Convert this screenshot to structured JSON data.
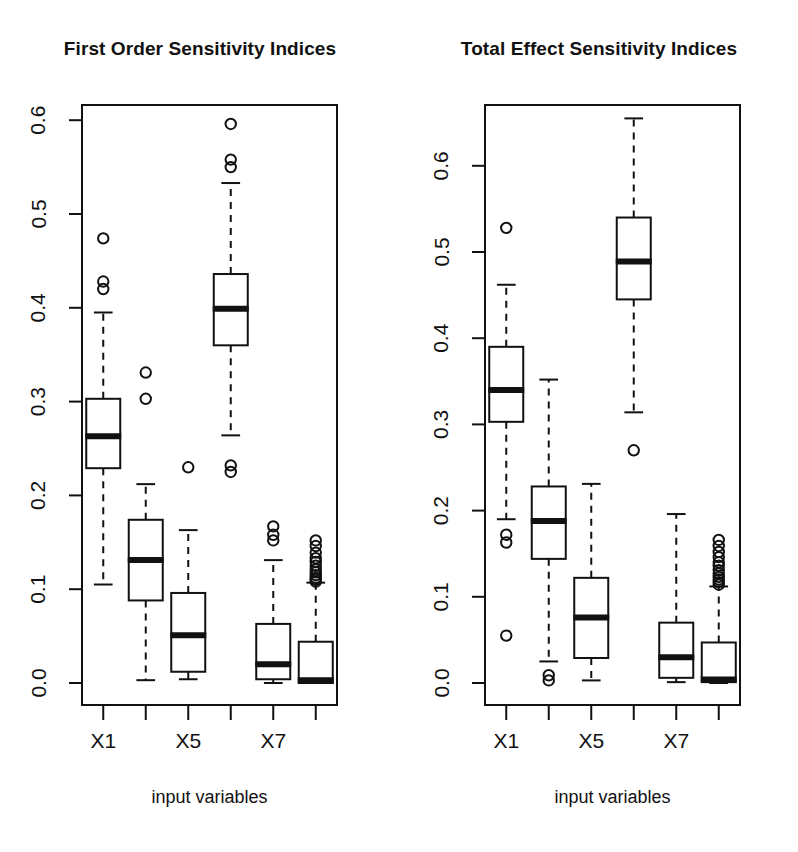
{
  "figure": {
    "background": "#ffffff",
    "ink": "#111111",
    "panels": [
      {
        "id": "first-order",
        "title": "First Order Sensitivity Indices",
        "xlabel": "input variables",
        "ylabel": "",
        "x_tick_labels": [
          "X1",
          "",
          "X5",
          "",
          "X7",
          ""
        ],
        "x_categories": [
          "X1",
          "X2",
          "X3",
          "X4",
          "X5",
          "X6"
        ],
        "y_tick_labels": [
          "0.0",
          "0.1",
          "0.2",
          "0.3",
          "0.4",
          "0.5",
          "0.6"
        ],
        "y_tick_values": [
          0.0,
          0.1,
          0.2,
          0.3,
          0.4,
          0.5,
          0.6
        ],
        "ylim": [
          -0.035,
          0.635
        ],
        "boxes": [
          {
            "category": "X1",
            "q1": 0.229,
            "median": 0.263,
            "q3": 0.303,
            "whisker_low": 0.105,
            "whisker_high": 0.395,
            "outliers": [
              0.474,
              0.428,
              0.42
            ]
          },
          {
            "category": "X2",
            "q1": 0.088,
            "median": 0.131,
            "q3": 0.174,
            "whisker_low": 0.003,
            "whisker_high": 0.212,
            "outliers": [
              0.331,
              0.303
            ]
          },
          {
            "category": "X3",
            "q1": 0.012,
            "median": 0.051,
            "q3": 0.096,
            "whisker_low": 0.004,
            "whisker_high": 0.163,
            "outliers": [
              0.23
            ]
          },
          {
            "category": "X4",
            "q1": 0.36,
            "median": 0.399,
            "q3": 0.436,
            "whisker_low": 0.264,
            "whisker_high": 0.533,
            "outliers": [
              0.596,
              0.558,
              0.55,
              0.232,
              0.225
            ]
          },
          {
            "category": "X5",
            "q1": 0.004,
            "median": 0.02,
            "q3": 0.063,
            "whisker_low": 0.0,
            "whisker_high": 0.131,
            "outliers": [
              0.167,
              0.158,
              0.152
            ]
          },
          {
            "category": "X6",
            "q1": 0.0,
            "median": 0.003,
            "q3": 0.044,
            "whisker_low": 0.0,
            "whisker_high": 0.107,
            "outliers": [
              0.152,
              0.146,
              0.139,
              0.133,
              0.129,
              0.125,
              0.121,
              0.118,
              0.115,
              0.112,
              0.11,
              0.108
            ]
          }
        ]
      },
      {
        "id": "total-effect",
        "title": "Total Effect Sensitivity Indices",
        "xlabel": "input variables",
        "ylabel": "",
        "x_tick_labels": [
          "X1",
          "",
          "X5",
          "",
          "X7",
          ""
        ],
        "x_categories": [
          "X1",
          "X2",
          "X3",
          "X4",
          "X5",
          "X6"
        ],
        "y_tick_labels": [
          "0.0",
          "0.1",
          "0.2",
          "0.3",
          "0.4",
          "0.5",
          "0.6"
        ],
        "y_tick_values": [
          0.0,
          0.1,
          0.2,
          0.3,
          0.4,
          0.5,
          0.6
        ],
        "ylim": [
          -0.035,
          0.685
        ],
        "boxes": [
          {
            "category": "X1",
            "q1": 0.303,
            "median": 0.34,
            "q3": 0.39,
            "whisker_low": 0.19,
            "whisker_high": 0.462,
            "outliers": [
              0.528,
              0.172,
              0.163,
              0.055
            ]
          },
          {
            "category": "X2",
            "q1": 0.144,
            "median": 0.188,
            "q3": 0.228,
            "whisker_low": 0.025,
            "whisker_high": 0.352,
            "outliers": [
              0.009,
              0.003
            ]
          },
          {
            "category": "X3",
            "q1": 0.029,
            "median": 0.076,
            "q3": 0.122,
            "whisker_low": 0.003,
            "whisker_high": 0.231,
            "outliers": []
          },
          {
            "category": "X4",
            "q1": 0.445,
            "median": 0.489,
            "q3": 0.54,
            "whisker_low": 0.314,
            "whisker_high": 0.655,
            "outliers": [
              0.27
            ]
          },
          {
            "category": "X5",
            "q1": 0.006,
            "median": 0.03,
            "q3": 0.07,
            "whisker_low": 0.001,
            "whisker_high": 0.196,
            "outliers": []
          },
          {
            "category": "X6",
            "q1": 0.001,
            "median": 0.004,
            "q3": 0.047,
            "whisker_low": 0.0,
            "whisker_high": 0.112,
            "outliers": [
              0.166,
              0.159,
              0.152,
              0.146,
              0.14,
              0.136,
              0.131,
              0.127,
              0.123,
              0.12,
              0.117,
              0.114
            ]
          }
        ]
      }
    ]
  },
  "chart_data": {
    "type": "box",
    "subplots": 2,
    "grid": false,
    "legend": "none",
    "panels": [
      {
        "title": "First Order Sensitivity Indices",
        "xlabel": "input variables",
        "ylabel": "",
        "categories": [
          "X1",
          "X2",
          "X3",
          "X4",
          "X5",
          "X6"
        ],
        "tick_labels_shown": [
          "X1",
          "X5",
          "X7"
        ],
        "yticks": [
          0.0,
          0.1,
          0.2,
          0.3,
          0.4,
          0.5,
          0.6
        ],
        "ylim": [
          0.0,
          0.6
        ],
        "boxes": [
          {
            "x": "X1",
            "min": 0.105,
            "q1": 0.229,
            "median": 0.263,
            "q3": 0.303,
            "max": 0.395,
            "outliers": [
              0.474,
              0.428,
              0.42
            ]
          },
          {
            "x": "X2",
            "min": 0.003,
            "q1": 0.088,
            "median": 0.131,
            "q3": 0.174,
            "max": 0.212,
            "outliers": [
              0.331,
              0.303
            ]
          },
          {
            "x": "X3",
            "min": 0.004,
            "q1": 0.012,
            "median": 0.051,
            "q3": 0.096,
            "max": 0.163,
            "outliers": [
              0.23
            ]
          },
          {
            "x": "X4",
            "min": 0.264,
            "q1": 0.36,
            "median": 0.399,
            "q3": 0.436,
            "max": 0.533,
            "outliers": [
              0.596,
              0.558,
              0.55,
              0.232,
              0.225
            ]
          },
          {
            "x": "X5",
            "min": 0.0,
            "q1": 0.004,
            "median": 0.02,
            "q3": 0.063,
            "max": 0.131,
            "outliers": [
              0.167,
              0.158,
              0.152
            ]
          },
          {
            "x": "X6",
            "min": 0.0,
            "q1": 0.0,
            "median": 0.003,
            "q3": 0.044,
            "max": 0.107,
            "outliers": [
              0.152,
              0.146,
              0.139,
              0.133,
              0.129,
              0.125,
              0.121,
              0.118,
              0.115,
              0.112,
              0.11,
              0.108
            ]
          }
        ]
      },
      {
        "title": "Total Effect Sensitivity Indices",
        "xlabel": "input variables",
        "ylabel": "",
        "categories": [
          "X1",
          "X2",
          "X3",
          "X4",
          "X5",
          "X6"
        ],
        "tick_labels_shown": [
          "X1",
          "X5",
          "X7"
        ],
        "yticks": [
          0.0,
          0.1,
          0.2,
          0.3,
          0.4,
          0.5,
          0.6
        ],
        "ylim": [
          0.0,
          0.66
        ],
        "boxes": [
          {
            "x": "X1",
            "min": 0.19,
            "q1": 0.303,
            "median": 0.34,
            "q3": 0.39,
            "max": 0.462,
            "outliers": [
              0.528,
              0.172,
              0.163,
              0.055
            ]
          },
          {
            "x": "X2",
            "min": 0.025,
            "q1": 0.144,
            "median": 0.188,
            "q3": 0.228,
            "max": 0.352,
            "outliers": [
              0.009,
              0.003
            ]
          },
          {
            "x": "X3",
            "min": 0.003,
            "q1": 0.029,
            "median": 0.076,
            "q3": 0.122,
            "max": 0.231,
            "outliers": []
          },
          {
            "x": "X4",
            "min": 0.314,
            "q1": 0.445,
            "median": 0.489,
            "q3": 0.54,
            "max": 0.655,
            "outliers": [
              0.27
            ]
          },
          {
            "x": "X5",
            "min": 0.001,
            "q1": 0.006,
            "median": 0.03,
            "q3": 0.07,
            "max": 0.196,
            "outliers": []
          },
          {
            "x": "X6",
            "min": 0.0,
            "q1": 0.001,
            "median": 0.004,
            "q3": 0.047,
            "max": 0.112,
            "outliers": [
              0.166,
              0.159,
              0.152,
              0.146,
              0.14,
              0.136,
              0.131,
              0.127,
              0.123,
              0.12,
              0.117,
              0.114
            ]
          }
        ]
      }
    ]
  }
}
